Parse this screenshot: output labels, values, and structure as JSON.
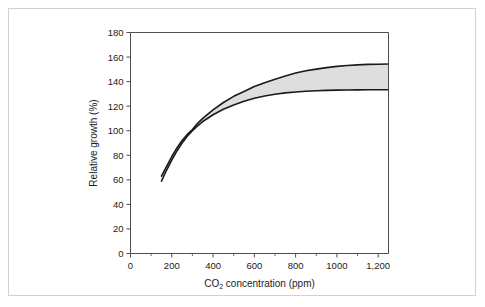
{
  "figure": {
    "background_color": "#ffffff",
    "frame_border_color": "#d2d2d2"
  },
  "chart_data": {
    "type": "area",
    "title": "",
    "subtitle": "",
    "xlabel_main": "CO",
    "xlabel_sub": "2",
    "xlabel_rest": " concentration (ppm)",
    "xlabel": "CO2 concentration (ppm)",
    "ylabel": "Relative growth (%)",
    "xlim": [
      0,
      1250
    ],
    "ylim": [
      0,
      180
    ],
    "grid": false,
    "legend": "none",
    "axis_color": "#4d4d4d",
    "line_color": "#1a1a1a",
    "band_fill_color": "#dedede",
    "xticks": [
      0,
      200,
      400,
      600,
      800,
      1000,
      1200
    ],
    "xtick_labels": [
      "0",
      "200",
      "400",
      "600",
      "800",
      "1000",
      "1,200"
    ],
    "xticks_minor": [
      100,
      300,
      500,
      700,
      900,
      1100
    ],
    "yticks": [
      0,
      20,
      40,
      60,
      80,
      100,
      120,
      140,
      160,
      180
    ],
    "ytick_labels": [
      "0",
      "20",
      "40",
      "60",
      "80",
      "100",
      "120",
      "140",
      "160",
      "180"
    ],
    "x": [
      150,
      175,
      200,
      225,
      250,
      275,
      300,
      325,
      350,
      400,
      450,
      500,
      550,
      600,
      650,
      700,
      750,
      800,
      850,
      900,
      950,
      1000,
      1050,
      1100,
      1150,
      1200,
      1250
    ],
    "series": [
      {
        "name": "upper bound",
        "values": [
          63,
          71,
          79,
          86,
          92,
          97,
          101,
          106,
          110,
          117,
          123,
          128,
          132,
          136,
          139,
          142,
          144.5,
          147,
          148.8,
          150.2,
          151.4,
          152.4,
          153.1,
          153.6,
          154.0,
          154.2,
          154.3
        ]
      },
      {
        "name": "lower bound",
        "values": [
          59,
          68,
          76,
          83.5,
          90,
          95.5,
          100,
          104,
          107.5,
          113,
          117.5,
          121,
          124,
          126.5,
          128.3,
          129.7,
          130.8,
          131.6,
          132.2,
          132.6,
          132.9,
          133.1,
          133.2,
          133.3,
          133.4,
          133.4,
          133.4
        ]
      }
    ],
    "annotations": []
  }
}
